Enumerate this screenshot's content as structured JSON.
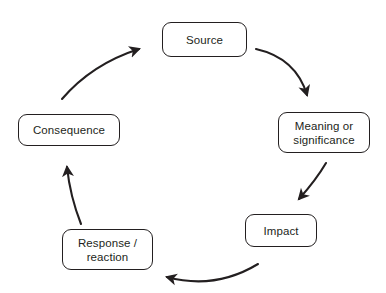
{
  "diagram": {
    "type": "cycle-diagram",
    "background_color": "#ffffff",
    "stroke_color": "#231f20",
    "text_color": "#231f20",
    "nodes": [
      {
        "id": "source",
        "label": "Source",
        "name": "node-source"
      },
      {
        "id": "meaning",
        "label": "Meaning or\nsignificance",
        "name": "node-meaning"
      },
      {
        "id": "impact",
        "label": "Impact",
        "name": "node-impact"
      },
      {
        "id": "response",
        "label": "Response /\nreaction",
        "name": "node-response"
      },
      {
        "id": "consequence",
        "label": "Consequence",
        "name": "node-consequence"
      }
    ],
    "arrows": [
      {
        "id": "source-to-meaning",
        "from": "source",
        "to": "meaning",
        "direction": "down-right"
      },
      {
        "id": "meaning-to-impact",
        "from": "meaning",
        "to": "impact",
        "direction": "down-left"
      },
      {
        "id": "impact-to-response",
        "from": "impact",
        "to": "response",
        "direction": "left"
      },
      {
        "id": "response-to-consequence",
        "from": "response",
        "to": "consequence",
        "direction": "up"
      },
      {
        "id": "consequence-to-source",
        "from": "consequence",
        "to": "source",
        "direction": "up-right"
      }
    ]
  }
}
